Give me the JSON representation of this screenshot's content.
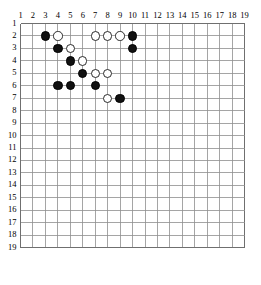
{
  "board": {
    "title": "Go board diagram",
    "size": 19,
    "origin_x": 20.5,
    "origin_y": 23.5,
    "spacing": 12.45,
    "stone_diameter": 9.4,
    "line_color": "#8e8e8e",
    "edge_color": "#6f6f6f",
    "background_color": "#ffffff",
    "black_color": "#111111",
    "white_color": "#ffffff",
    "white_outline_color": "#2a2a2a"
  },
  "labels": {
    "columns": [
      "1",
      "2",
      "3",
      "4",
      "5",
      "6",
      "7",
      "8",
      "9",
      "10",
      "11",
      "12",
      "13",
      "14",
      "15",
      "16",
      "17",
      "18",
      "19"
    ],
    "rows": [
      "1",
      "2",
      "3",
      "4",
      "5",
      "6",
      "7",
      "8",
      "9",
      "10",
      "11",
      "12",
      "13",
      "14",
      "15",
      "16",
      "17",
      "18",
      "19"
    ]
  },
  "stones": [
    {
      "col": 3,
      "row": 2,
      "color": "black"
    },
    {
      "col": 4,
      "row": 2,
      "color": "white"
    },
    {
      "col": 7,
      "row": 2,
      "color": "white"
    },
    {
      "col": 8,
      "row": 2,
      "color": "white"
    },
    {
      "col": 9,
      "row": 2,
      "color": "white"
    },
    {
      "col": 10,
      "row": 2,
      "color": "black"
    },
    {
      "col": 4,
      "row": 3,
      "color": "black"
    },
    {
      "col": 5,
      "row": 3,
      "color": "white"
    },
    {
      "col": 10,
      "row": 3,
      "color": "black"
    },
    {
      "col": 5,
      "row": 4,
      "color": "black"
    },
    {
      "col": 6,
      "row": 4,
      "color": "white"
    },
    {
      "col": 6,
      "row": 5,
      "color": "black"
    },
    {
      "col": 7,
      "row": 5,
      "color": "white"
    },
    {
      "col": 8,
      "row": 5,
      "color": "white"
    },
    {
      "col": 4,
      "row": 6,
      "color": "black"
    },
    {
      "col": 5,
      "row": 6,
      "color": "black"
    },
    {
      "col": 7,
      "row": 6,
      "color": "black"
    },
    {
      "col": 8,
      "row": 7,
      "color": "white"
    },
    {
      "col": 9,
      "row": 7,
      "color": "black"
    }
  ],
  "counts": {
    "black_stones": 10,
    "white_stones": 9,
    "total_stones": 19
  }
}
